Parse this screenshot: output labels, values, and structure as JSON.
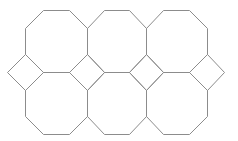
{
  "diagram": {
    "type": "octagon-square tiling",
    "stroke_color": "#8c8c8c",
    "background": "#ffffff",
    "rows": 2,
    "columns": 3,
    "octagon_count": 6,
    "square_count": 4
  }
}
